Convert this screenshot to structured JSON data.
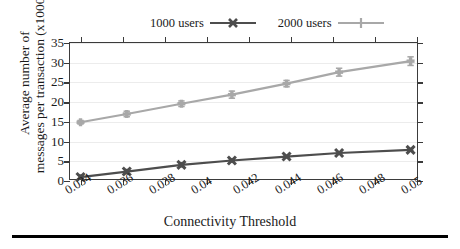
{
  "chart_data": {
    "type": "line",
    "title": "",
    "xlabel": "Connectivity Threshold",
    "ylabel": "Average number of messages per transaction (x1000)",
    "ylabel_line1": "Average number of",
    "ylabel_line2": "messages per transaction (x1000)",
    "xlim": [
      0.0335,
      0.0501
    ],
    "ylim": [
      0,
      35
    ],
    "xticks": [
      0.034,
      0.036,
      0.038,
      0.04,
      0.042,
      0.044,
      0.046,
      0.048,
      0.05
    ],
    "xticklabels": [
      "0.034",
      "0.036",
      "0.038",
      "0.04",
      "0.042",
      "0.044",
      "0.046",
      "0.048",
      "0.05"
    ],
    "yticks": [
      0,
      5,
      10,
      15,
      20,
      25,
      30,
      35
    ],
    "yticklabels": [
      "0",
      "5",
      "10",
      "15",
      "20",
      "25",
      "30",
      "35"
    ],
    "grid": "horizontal",
    "legend_position": "above-plot",
    "x": [
      0.034,
      0.036,
      0.038,
      0.04,
      0.042,
      0.044,
      0.046,
      0.048,
      0.05
    ],
    "series": [
      {
        "name": "1000 users",
        "label": "1000 users",
        "color": "#4d4d4d",
        "marker": "x-cross",
        "values": [
          1.0,
          2.4,
          4.1,
          5.2,
          6.2,
          7.1,
          7.9
        ],
        "x_values": [
          0.034,
          0.0362,
          0.0388,
          0.0412,
          0.0438,
          0.0463,
          0.0497
        ],
        "errors": [
          0.5,
          0.5,
          0.5,
          0.35,
          0.3,
          0.3,
          0.35
        ]
      },
      {
        "name": "2000 users",
        "label": "2000 users",
        "color": "#a8a8a8",
        "marker": "plus",
        "values": [
          14.9,
          17.0,
          19.6,
          21.9,
          24.7,
          27.6,
          30.4
        ],
        "x_values": [
          0.034,
          0.0362,
          0.0388,
          0.0412,
          0.0438,
          0.0463,
          0.0497
        ],
        "errors": [
          0.45,
          0.7,
          0.7,
          0.9,
          0.8,
          1.0,
          1.1
        ]
      }
    ]
  },
  "legend": {
    "entries": [
      {
        "label": "1000 users",
        "color": "#4d4d4d",
        "marker": "x-cross"
      },
      {
        "label": "2000 users",
        "color": "#a8a8a8",
        "marker": "plus"
      }
    ]
  },
  "axes": {
    "x_title": "Connectivity Threshold",
    "y_title_line1": "Average number of",
    "y_title_line2": "messages per transaction (x1000)"
  }
}
